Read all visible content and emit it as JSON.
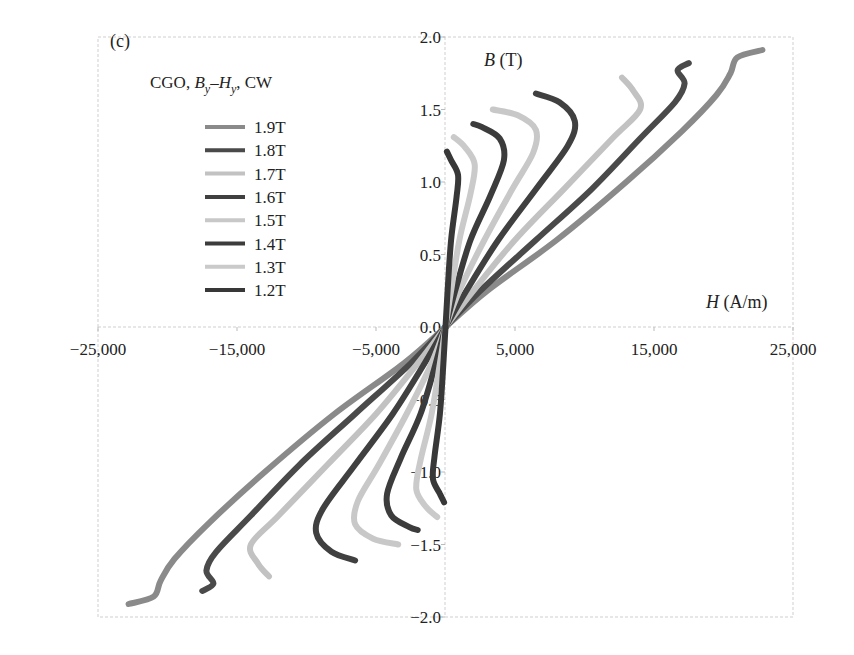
{
  "panel_label": "(c)",
  "chart_data": {
    "type": "line",
    "title": "CGO, By–Hy, CW",
    "title_parts": {
      "prefix": "CGO, ",
      "b": "B",
      "b_sub": "y",
      "dash": "–",
      "h": "H",
      "h_sub": "y",
      "suffix": ", CW"
    },
    "xlabel": "H (A/m)",
    "xlabel_parts": {
      "var": "H",
      "unit": " (A/m)"
    },
    "ylabel": "B (T)",
    "ylabel_parts": {
      "var": "B",
      "unit": " (T)"
    },
    "xlim": [
      -25000,
      25000
    ],
    "ylim": [
      -2.0,
      2.0
    ],
    "x_ticks": [
      -25000,
      -15000,
      -5000,
      5000,
      15000,
      25000
    ],
    "x_tick_labels": [
      "−25,000",
      "−15,000",
      "−5,000",
      "5,000",
      "15,000",
      "25,000"
    ],
    "y_ticks": [
      2.0,
      1.5,
      1.0,
      0.5,
      0.0,
      -0.5,
      -1.0,
      -1.5,
      -2.0
    ],
    "y_tick_labels": [
      "2.0",
      "1.5",
      "1.0",
      "0.5",
      "0.0",
      "−0.5",
      "−1.0",
      "−1.5",
      "−2.0"
    ],
    "grid": false,
    "legend_position": "upper-left",
    "symmetry": "odd (curve mirrored through origin: (H,B) -> (-H,-B))",
    "series": [
      {
        "name": "1.9T",
        "color": "#8a8a8a",
        "width": 6,
        "points": [
          [
            0,
            0
          ],
          [
            3000,
            0.25
          ],
          [
            8000,
            0.6
          ],
          [
            13000,
            1.0
          ],
          [
            17000,
            1.35
          ],
          [
            19500,
            1.6
          ],
          [
            20500,
            1.75
          ],
          [
            21000,
            1.86
          ],
          [
            22800,
            1.91
          ]
        ]
      },
      {
        "name": "1.8T",
        "color": "#4a4a4a",
        "width": 6,
        "points": [
          [
            0,
            0
          ],
          [
            2500,
            0.25
          ],
          [
            6500,
            0.6
          ],
          [
            10500,
            0.95
          ],
          [
            14000,
            1.3
          ],
          [
            16500,
            1.55
          ],
          [
            17200,
            1.68
          ],
          [
            16700,
            1.77
          ],
          [
            17500,
            1.82
          ]
        ]
      },
      {
        "name": "1.7T",
        "color": "#c2c2c2",
        "width": 6,
        "points": [
          [
            0,
            0
          ],
          [
            2000,
            0.25
          ],
          [
            5000,
            0.6
          ],
          [
            8500,
            0.95
          ],
          [
            12000,
            1.3
          ],
          [
            14000,
            1.5
          ],
          [
            13500,
            1.63
          ],
          [
            12700,
            1.72
          ]
        ]
      },
      {
        "name": "1.6T",
        "color": "#404040",
        "width": 6,
        "points": [
          [
            0,
            0
          ],
          [
            1500,
            0.25
          ],
          [
            3800,
            0.6
          ],
          [
            6500,
            0.95
          ],
          [
            8800,
            1.25
          ],
          [
            9300,
            1.42
          ],
          [
            8200,
            1.55
          ],
          [
            6500,
            1.61
          ]
        ]
      },
      {
        "name": "1.5T",
        "color": "#c8c8c8",
        "width": 6,
        "points": [
          [
            0,
            0
          ],
          [
            1000,
            0.25
          ],
          [
            2800,
            0.6
          ],
          [
            4800,
            0.95
          ],
          [
            6300,
            1.2
          ],
          [
            6500,
            1.36
          ],
          [
            5200,
            1.46
          ],
          [
            3400,
            1.5
          ]
        ]
      },
      {
        "name": "1.4T",
        "color": "#3c3c3c",
        "width": 6,
        "points": [
          [
            0,
            0
          ],
          [
            700,
            0.25
          ],
          [
            1800,
            0.6
          ],
          [
            3200,
            0.9
          ],
          [
            4200,
            1.15
          ],
          [
            3900,
            1.3
          ],
          [
            2600,
            1.38
          ],
          [
            2000,
            1.4
          ]
        ]
      },
      {
        "name": "1.3T",
        "color": "#cacaca",
        "width": 6,
        "points": [
          [
            0,
            0
          ],
          [
            400,
            0.25
          ],
          [
            1000,
            0.6
          ],
          [
            1800,
            0.92
          ],
          [
            2100,
            1.12
          ],
          [
            1400,
            1.24
          ],
          [
            600,
            1.31
          ]
        ]
      },
      {
        "name": "1.2T",
        "color": "#383838",
        "width": 6,
        "points": [
          [
            0,
            0
          ],
          [
            150,
            0.25
          ],
          [
            400,
            0.6
          ],
          [
            800,
            0.9
          ],
          [
            900,
            1.05
          ],
          [
            400,
            1.15
          ],
          [
            100,
            1.21
          ]
        ]
      }
    ]
  }
}
